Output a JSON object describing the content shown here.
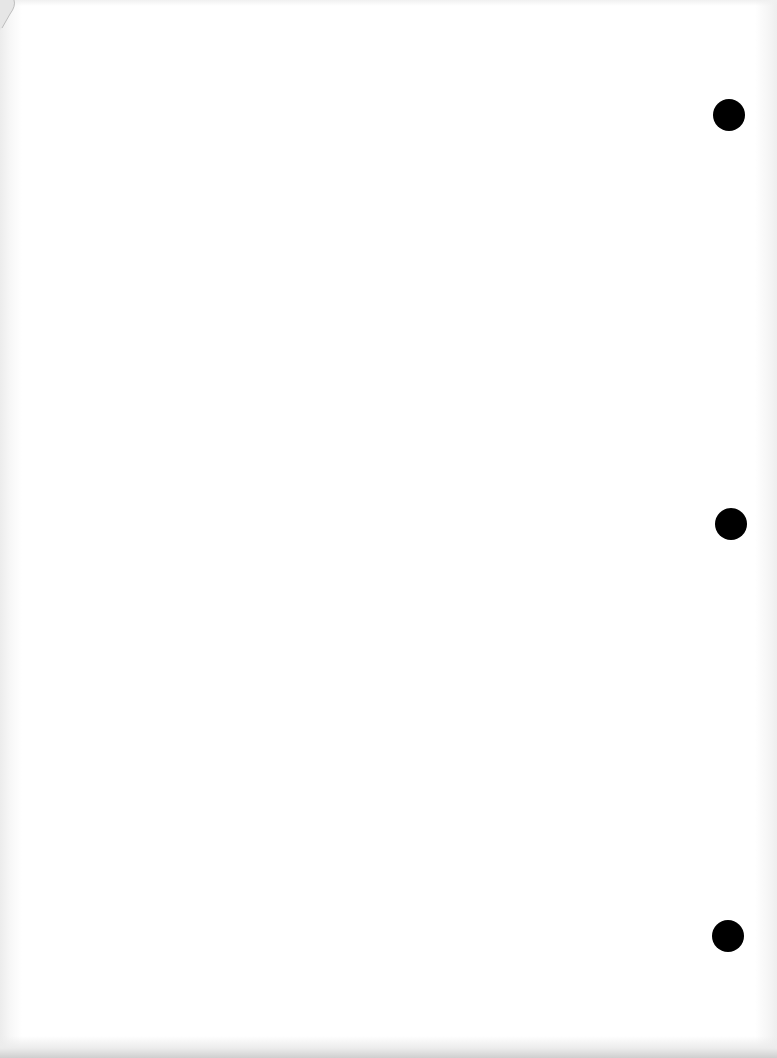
{
  "document": {
    "type": "blank-three-hole-punched-page",
    "text": "",
    "background_color": "#ffffff",
    "hole_color": "#000000",
    "punch_holes": [
      {
        "cx": 729,
        "cy": 115,
        "r": 16
      },
      {
        "cx": 731,
        "cy": 524,
        "r": 16
      },
      {
        "cx": 728,
        "cy": 936,
        "r": 16
      }
    ]
  }
}
